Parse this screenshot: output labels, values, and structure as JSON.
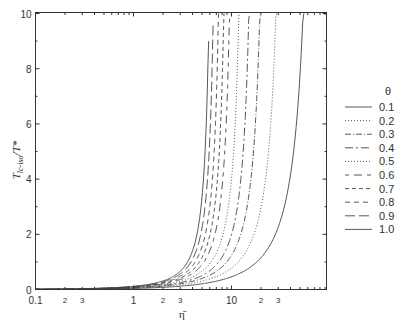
{
  "chart_data": {
    "type": "line",
    "title": "",
    "xlabel": "η̄",
    "ylabel": "T_lc-iso / T*",
    "ylabel_main": "T",
    "ylabel_sub": "lc-iso",
    "ylabel_tail": "/T*",
    "xscale": "log",
    "xlim": [
      0.1,
      90
    ],
    "ylim": [
      0,
      10
    ],
    "grid": false,
    "legend_position": "right",
    "legend_title": "θ",
    "y_ticks": [
      0,
      2,
      4,
      6,
      8,
      10
    ],
    "y_tick_labels": [
      "0",
      "2",
      "4",
      "6",
      "8",
      "10"
    ],
    "x_major_ticks": [
      0.1,
      1,
      10
    ],
    "x_major_labels": [
      "0.1",
      "1",
      "10"
    ],
    "x_minor_labeled": [
      {
        "value": 0.2,
        "label": "2"
      },
      {
        "value": 0.3,
        "label": "3"
      },
      {
        "value": 2,
        "label": "2"
      },
      {
        "value": 3,
        "label": "3"
      },
      {
        "value": 20,
        "label": "2"
      },
      {
        "value": 30,
        "label": "3"
      }
    ],
    "series": [
      {
        "name": "0.1",
        "style": "solid",
        "dash": "",
        "asymptote": 85.0,
        "ymax": 10.0
      },
      {
        "name": "0.2",
        "style": "dotted",
        "dash": "1,2",
        "asymptote": 40.0,
        "ymax": 10.0
      },
      {
        "name": "0.3",
        "style": "dash-dot",
        "dash": "6,2,1,2",
        "asymptote": 26.0,
        "ymax": 10.0
      },
      {
        "name": "0.4",
        "style": "dash-dot-long",
        "dash": "8,3,2,3",
        "asymptote": 19.5,
        "ymax": 10.0
      },
      {
        "name": "0.5",
        "style": "dotted",
        "dash": "1,2",
        "asymptote": 15.0,
        "ymax": 10.0
      },
      {
        "name": "0.6",
        "style": "dash",
        "dash": "4,5,8,5",
        "asymptote": 11.8,
        "ymax": 10.0
      },
      {
        "name": "0.7",
        "style": "dash",
        "dash": "4,3",
        "asymptote": 10.2,
        "ymax": 10.0
      },
      {
        "name": "0.8",
        "style": "dash",
        "dash": "5,4",
        "asymptote": 8.9,
        "ymax": 10.0
      },
      {
        "name": "0.9",
        "style": "long-dash",
        "dash": "10,4",
        "asymptote": 7.8,
        "ymax": 9.6
      },
      {
        "name": "1.0",
        "style": "solid",
        "dash": "",
        "asymptote": 7.0,
        "ymax": 9.0
      }
    ]
  }
}
